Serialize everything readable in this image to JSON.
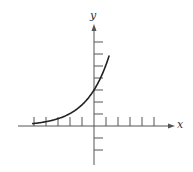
{
  "figure": {
    "type": "exponential-growth-graph",
    "axes": {
      "x_label": "x",
      "y_label": "y"
    },
    "colors": {
      "axis": "#555555",
      "curve": "#222222",
      "background": "#ffffff"
    }
  },
  "chart_data": {
    "type": "line",
    "title": "",
    "xlabel": "x",
    "ylabel": "y",
    "grid": false,
    "legend": null,
    "x_ticks": [
      -5,
      -4,
      -3,
      -2,
      -1,
      1,
      2,
      3,
      4,
      5
    ],
    "y_ticks": [
      -2,
      -1,
      1,
      2,
      3,
      4,
      5,
      6,
      7
    ],
    "xlim": [
      -6.5,
      6.7
    ],
    "ylim": [
      -3.3,
      8.3
    ],
    "series": [
      {
        "name": "exponential curve",
        "description": "increasing exponential, approximately y = 3 * 1.7^x",
        "x": [
          -5,
          -4,
          -3,
          -2,
          -1,
          0,
          0.5,
          1,
          1.25
        ],
        "y": [
          0.21,
          0.36,
          0.61,
          1.04,
          1.76,
          3.0,
          3.9,
          5.1,
          5.8
        ]
      }
    ],
    "annotations": []
  }
}
